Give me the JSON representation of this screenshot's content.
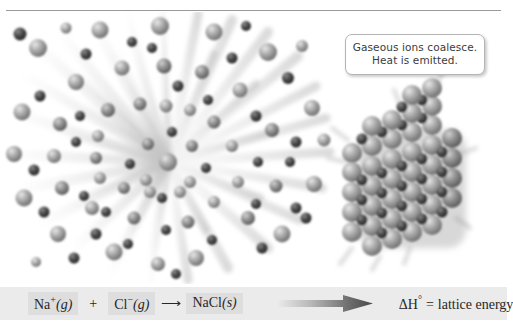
{
  "figure": {
    "title_rule": true,
    "callout": {
      "line1": "Gaseous ions coalesce.",
      "line2": "Heat is emitted."
    },
    "equation": {
      "reactant1": {
        "formula": "Na",
        "charge": "+",
        "state": "(g)"
      },
      "plus": "+",
      "reactant2": {
        "formula": "Cl",
        "charge": "−",
        "state": "(g)"
      },
      "reaction_arrow": "⟶",
      "product": {
        "formula": "NaCl",
        "state": "(s)"
      },
      "energy_label": {
        "symbol": "ΔH",
        "degree": "°",
        "equals": "=",
        "text": "lattice energy"
      }
    },
    "scene": {
      "left_label": "gaseous ions radiating outward",
      "right_label": "sodium chloride crystal lattice"
    },
    "colors": {
      "bar_background": "#ebebeb",
      "chip_background": "#dedede",
      "text": "#272727",
      "callout_text": "#3b3b3b",
      "callout_border": "#b4b4b4",
      "rule": "#9a9a9a",
      "cation_sphere": "#a6a6a6",
      "anion_sphere": "#4a4a4a",
      "arrow_dark": "#555555"
    }
  }
}
